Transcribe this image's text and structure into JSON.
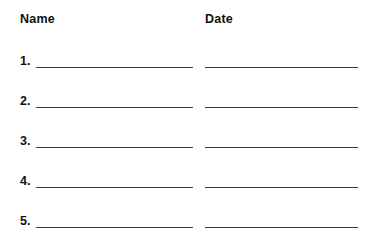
{
  "document": {
    "type": "sign-in-sheet",
    "background_color": "#ffffff",
    "rule_color": "#3a3a3a",
    "text_color": "#111111"
  },
  "headers": {
    "name": "Name",
    "date": "Date"
  },
  "rows": [
    {
      "number": "1.",
      "name_value": "",
      "date_value": ""
    },
    {
      "number": "2.",
      "name_value": "",
      "date_value": ""
    },
    {
      "number": "3.",
      "name_value": "",
      "date_value": ""
    },
    {
      "number": "4.",
      "name_value": "",
      "date_value": ""
    },
    {
      "number": "5.",
      "name_value": "",
      "date_value": ""
    }
  ]
}
